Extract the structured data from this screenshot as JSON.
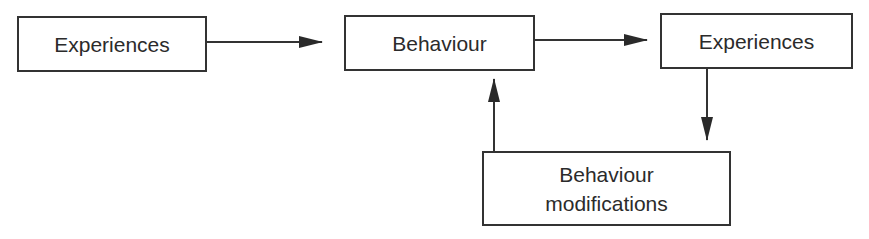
{
  "diagram": {
    "type": "flowchart",
    "nodes": [
      {
        "id": "experiences_1",
        "label": "Experiences"
      },
      {
        "id": "behaviour",
        "label": "Behaviour"
      },
      {
        "id": "experiences_2",
        "label": "Experiences"
      },
      {
        "id": "behaviour_modifications",
        "label_line1": "Behaviour",
        "label_line2": "modifications"
      }
    ],
    "edges": [
      {
        "from": "experiences_1",
        "to": "behaviour"
      },
      {
        "from": "behaviour",
        "to": "experiences_2"
      },
      {
        "from": "experiences_2",
        "to": "behaviour_modifications"
      },
      {
        "from": "behaviour_modifications",
        "to": "behaviour"
      }
    ],
    "colors": {
      "stroke": "#333333",
      "text": "#2b2b2b",
      "background": "#ffffff"
    }
  }
}
